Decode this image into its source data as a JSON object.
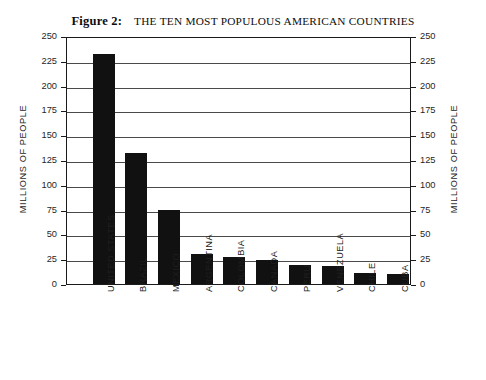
{
  "title": {
    "figure_label": "Figure 2:",
    "text": "THE TEN MOST POPULOUS AMERICAN COUNTRIES"
  },
  "axis_title_left": "MILLIONS OF PEOPLE",
  "axis_title_right": "MILLIONS OF PEOPLE",
  "chart_data": {
    "type": "bar",
    "xlabel": "",
    "ylabel": "MILLIONS OF PEOPLE",
    "ylabel_right": "MILLIONS OF PEOPLE",
    "ylim": [
      0,
      250
    ],
    "ytick_step": 25,
    "yticks": [
      0,
      25,
      50,
      75,
      100,
      125,
      150,
      175,
      200,
      225,
      250
    ],
    "ytick_labels": [
      "0",
      "25",
      "50",
      "75",
      "100",
      "125",
      "150",
      "175",
      "200",
      "225",
      "250"
    ],
    "grid": true,
    "grid_axis": "y",
    "legend": false,
    "bar_color": "#111111",
    "categories": [
      "UNITED STATES",
      "BRAZIL",
      "MEXICO",
      "ARGENTINA",
      "COLOMBIA",
      "CANADA",
      "PERU",
      "VENEZUELA",
      "CHILE",
      "CUBA"
    ],
    "values": [
      232,
      132,
      75,
      30,
      27,
      24,
      19,
      18,
      11,
      10
    ]
  }
}
